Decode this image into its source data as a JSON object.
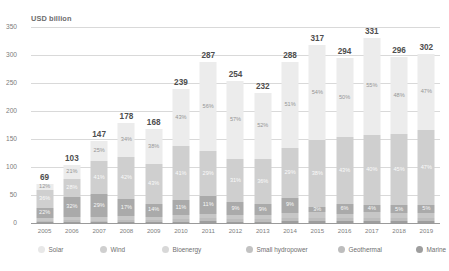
{
  "chart_data": {
    "type": "bar",
    "subtype": "stacked-percent-with-totals",
    "title": "",
    "ylabel": "USD billion",
    "xlabel": "",
    "ylim": [
      0,
      350
    ],
    "yticks": [
      0,
      50,
      100,
      150,
      200,
      250,
      300,
      350
    ],
    "ytick_labels": [
      "0",
      "50",
      "100",
      "150",
      "200",
      "250",
      "300",
      "350"
    ],
    "grid": true,
    "legend_position": "bottom",
    "categories": [
      "2005",
      "2006",
      "2007",
      "2008",
      "2009",
      "2010",
      "2011",
      "2012",
      "2013",
      "2014",
      "2015",
      "2016",
      "2017",
      "2018",
      "2019"
    ],
    "totals": [
      69,
      103,
      147,
      178,
      168,
      239,
      287,
      254,
      232,
      288,
      317,
      294,
      331,
      296,
      302
    ],
    "total_labels": [
      "69",
      "103",
      "147",
      "178",
      "168",
      "239",
      "287",
      "254",
      "232",
      "288",
      "317",
      "294",
      "331",
      "296",
      "302"
    ],
    "series": [
      {
        "name": "Marine",
        "color": "#9e9e9e",
        "values": [
          1,
          1,
          1,
          1,
          1,
          1,
          1,
          1,
          1,
          1,
          1,
          1,
          1,
          1,
          1
        ],
        "labels": [
          "",
          "",
          "",
          "",
          "",
          "",
          "",
          "",
          "",
          "",
          "",
          "",
          "",
          "",
          ""
        ]
      },
      {
        "name": "Geothermal",
        "color": "#bdbdbd",
        "values": [
          3,
          3,
          2,
          2,
          2,
          2,
          2,
          2,
          2,
          2,
          2,
          2,
          2,
          2,
          2
        ],
        "labels": [
          "",
          "",
          "",
          "",
          "",
          "",
          "",
          "",
          "",
          "",
          "",
          "",
          "",
          "",
          ""
        ]
      },
      {
        "name": "Small hydropower",
        "color": "#c7c7c7",
        "values": [
          6,
          5,
          4,
          4,
          4,
          3,
          3,
          3,
          3,
          3,
          3,
          3,
          3,
          3,
          3
        ],
        "labels": [
          "",
          "",
          "",
          "",
          "",
          "",
          "",
          "",
          "",
          "",
          "",
          "",
          "",
          "",
          ""
        ]
      },
      {
        "name": "Bioenergy",
        "color": "#aaaaaa",
        "values": [
          22,
          32,
          29,
          17,
          14,
          11,
          11,
          9,
          9,
          9,
          3,
          6,
          4,
          5,
          5
        ],
        "labels": [
          "22%",
          "32%",
          "29%",
          "17%",
          "14%",
          "11%",
          "11%",
          "9%",
          "9%",
          "9%",
          "3%",
          "6%",
          "4%",
          "5%",
          "5%"
        ]
      },
      {
        "name": "Wind",
        "color": "#cfcfcf",
        "values": [
          36,
          28,
          41,
          42,
          43,
          41,
          29,
          31,
          36,
          29,
          38,
          43,
          40,
          45,
          47
        ],
        "labels": [
          "36%",
          "28%",
          "41%",
          "42%",
          "43%",
          "41%",
          "29%",
          "31%",
          "36%",
          "29%",
          "38%",
          "43%",
          "40%",
          "45%",
          "47%"
        ]
      },
      {
        "name": "Solar",
        "color": "#ececec",
        "values": [
          12,
          21,
          25,
          34,
          38,
          43,
          56,
          57,
          52,
          51,
          54,
          50,
          55,
          48,
          47
        ],
        "labels": [
          "12%",
          "21%",
          "25%",
          "34%",
          "38%",
          "43%",
          "56%",
          "57%",
          "52%",
          "51%",
          "54%",
          "50%",
          "55%",
          "48%",
          "47%"
        ]
      }
    ],
    "legend": [
      {
        "label": "Solar",
        "color": "#e8e8e8"
      },
      {
        "label": "Wind",
        "color": "#cfcfcf"
      },
      {
        "label": "Bioenergy",
        "color": "#d8d8d8"
      },
      {
        "label": "Small hydropower",
        "color": "#c2c2c2"
      },
      {
        "label": "Geothermal",
        "color": "#bdbdbd"
      },
      {
        "label": "Marine",
        "color": "#9e9e9e"
      }
    ]
  }
}
